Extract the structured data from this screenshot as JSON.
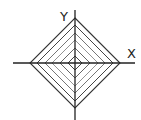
{
  "diagram": {
    "center": [
      75,
      63
    ],
    "axes": {
      "x": {
        "label": "X",
        "from": 13,
        "to": 135,
        "y": 63,
        "label_pos": [
          127,
          58
        ]
      },
      "y": {
        "label": "Y",
        "from": 10,
        "to": 120,
        "x": 75,
        "label_pos": [
          60,
          21
        ]
      }
    },
    "diamonds": [
      {
        "half": 45,
        "color": "#333333",
        "width": 1.1
      },
      {
        "half": 38,
        "color": "#444444",
        "width": 1.0
      },
      {
        "half": 30,
        "color": "#666666",
        "width": 0.9
      },
      {
        "half": 23,
        "color": "#888888",
        "width": 0.9
      },
      {
        "half": 15,
        "color": "#555555",
        "width": 0.9
      },
      {
        "half": 7,
        "color": "#444444",
        "width": 1.0
      }
    ],
    "axis_color": "#222222"
  }
}
